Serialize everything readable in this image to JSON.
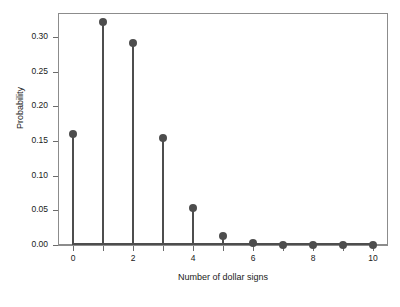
{
  "chart_data": {
    "type": "scatter",
    "title": "",
    "subtitle": "",
    "xlabel": "Number of dollar signs",
    "ylabel": "Probability",
    "x": [
      0,
      1,
      2,
      3,
      4,
      5,
      6,
      7,
      8,
      9,
      10
    ],
    "values": [
      0.161,
      0.322,
      0.291,
      0.155,
      0.054,
      0.013,
      0.003,
      0.0005,
      0.0001,
      0.0,
      0.0
    ],
    "series": [
      {
        "name": "Probability",
        "values": [
          0.161,
          0.322,
          0.291,
          0.155,
          0.054,
          0.013,
          0.003,
          0.0005,
          0.0001,
          0.0,
          0.0
        ]
      }
    ],
    "xlim": [
      -0.5,
      10.5
    ],
    "ylim": [
      0.0,
      0.335
    ],
    "xticks": [
      0,
      1,
      2,
      3,
      4,
      5,
      6,
      7,
      8,
      9,
      10
    ],
    "xtick_labels_shown": [
      "0",
      "",
      "2",
      "",
      "4",
      "",
      "6",
      "",
      "8",
      "",
      "10"
    ],
    "yticks": [
      0.0,
      0.05,
      0.1,
      0.15,
      0.2,
      0.25,
      0.3
    ],
    "ytick_labels": [
      "0.00",
      "0.05",
      "0.10",
      "0.15",
      "0.20",
      "0.25",
      "0.30"
    ],
    "grid": false,
    "legend": false,
    "legend_position": "none",
    "marker": "filled-circle",
    "stems": true,
    "colors": {
      "marker": "#4d4d4d",
      "stem": "#4d4d4d",
      "axis": "#8c8c8c",
      "text": "#1a1a1a",
      "background": "#ffffff"
    }
  }
}
